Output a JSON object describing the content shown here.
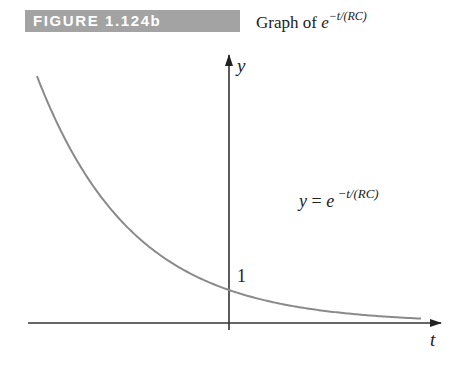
{
  "header": {
    "badge_label": "FIGURE 1.124b",
    "caption_prefix": "Graph of",
    "caption_base": "e",
    "caption_exponent": "−t/(RC)"
  },
  "colors": {
    "badge_bg": "#a3a3a3",
    "badge_text": "#ffffff",
    "curve": "#8a8a8a",
    "axis": "#333333"
  },
  "chart_data": {
    "type": "line",
    "xlabel": "t",
    "ylabel": "y",
    "function": "y = e^(-t/(RC))",
    "annotations": [
      {
        "text": "y = e^(−t/(RC))",
        "position": "right of y-axis, mid-height"
      },
      {
        "text": "1",
        "position": "y-intercept"
      }
    ],
    "series": [
      {
        "name": "y = e^(−t/(RC))",
        "x": [
          -2.0,
          -1.5,
          -1.0,
          -0.5,
          0,
          0.5,
          1.0,
          1.5,
          2.0
        ],
        "values": [
          7.39,
          4.48,
          2.72,
          1.65,
          1.0,
          0.61,
          0.37,
          0.22,
          0.14
        ]
      }
    ],
    "ticks": {
      "y": [
        {
          "value": 1,
          "label": "1"
        }
      ],
      "x": []
    },
    "grid": false,
    "legend": "none",
    "xlim": [
      -2.0,
      2.2
    ],
    "ylim": [
      0,
      8
    ]
  },
  "labels": {
    "eq_prefix": "y",
    "eq_equals": " = ",
    "eq_base": "e",
    "eq_exponent": " −t/(RC)",
    "y_axis": "y",
    "x_axis": "t",
    "y_intercept": "1"
  }
}
